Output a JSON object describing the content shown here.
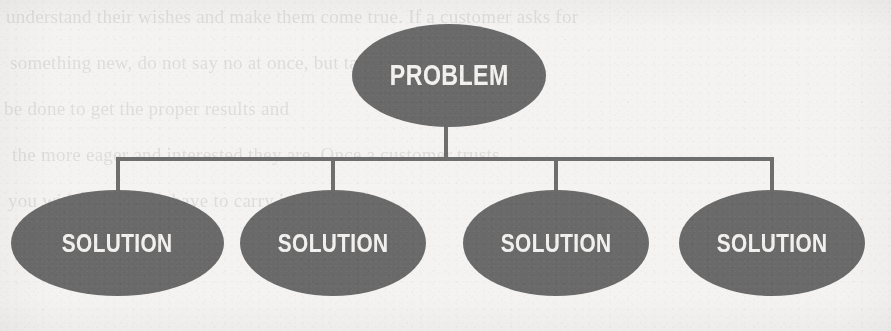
{
  "diagram": {
    "type": "hierarchy-tree",
    "title_node": {
      "id": "problem",
      "label": "PROBLEM",
      "shape": "ellipse",
      "fill": "#6a6a6a",
      "text_color": "#f2f1ef"
    },
    "child_nodes": [
      {
        "id": "solution-1",
        "label": "SOLUTION",
        "shape": "ellipse",
        "fill": "#6a6a6a",
        "text_color": "#f2f1ef"
      },
      {
        "id": "solution-2",
        "label": "SOLUTION",
        "shape": "ellipse",
        "fill": "#6a6a6a",
        "text_color": "#f2f1ef"
      },
      {
        "id": "solution-3",
        "label": "SOLUTION",
        "shape": "ellipse",
        "fill": "#6a6a6a",
        "text_color": "#f2f1ef"
      },
      {
        "id": "solution-4",
        "label": "SOLUTION",
        "shape": "ellipse",
        "fill": "#6a6a6a",
        "text_color": "#f2f1ef"
      }
    ],
    "connector_color": "#6e6e6e",
    "background_color": "#f4f3f1"
  },
  "background_bleedthrough": {
    "note": "faint mirrored show-through text from the reverse side of the printed page",
    "lines": [
      "understand their wishes and make them come true. If a customer asks for",
      "something new, do not say no at once, but take a look at what might",
      "be done to get the proper results and",
      "the more eager and interested they are. Once a customer trusts",
      "you with a task, you have to carry it out"
    ]
  }
}
